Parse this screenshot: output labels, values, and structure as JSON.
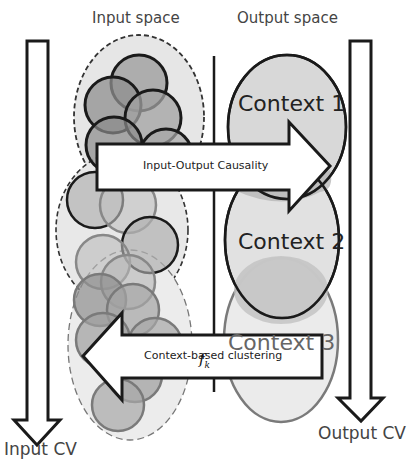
{
  "diagram": {
    "headers": {
      "input_space": "Input space",
      "output_space": "Output space"
    },
    "axes": {
      "input_cv": "Input CV",
      "output_cv": "Output CV"
    },
    "contexts": [
      {
        "label": "Context 1",
        "fill": "#d9d9d9",
        "stroke": "#1a1a1a"
      },
      {
        "label": "Context 2",
        "fill": "#e2e2e2",
        "stroke": "#1a1a1a"
      },
      {
        "label": "Context 3",
        "fill": "#ebebeb",
        "stroke": "#7a7a7a"
      }
    ],
    "arrows": {
      "causality": "Input-Output Causality",
      "clustering": "Context-based clustering"
    },
    "function_label": {
      "main": "f",
      "subscript": "k"
    },
    "colors": {
      "dark_cluster": "#8c8c8c",
      "mid_cluster": "#a8a8a8",
      "light_cluster": "#bdbdbd",
      "dashed_region": "#e4e4e4",
      "outline": "#1a1a1a"
    }
  }
}
